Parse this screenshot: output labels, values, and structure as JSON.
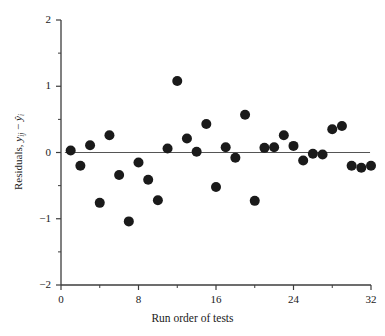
{
  "chart_data": {
    "type": "scatter",
    "title": "",
    "xlabel": "Run order of tests",
    "ylabel": "Residuals, y  − ŷ",
    "ylabel_parts": {
      "lead": "Residuals,",
      "var1": "y",
      "sub1": "ij",
      "minus": "−",
      "var2": "ŷ",
      "sub2": "i"
    },
    "xlim": [
      0,
      32
    ],
    "ylim": [
      -2,
      2
    ],
    "xticks": [
      0,
      8,
      16,
      24,
      32
    ],
    "xticklabels": [
      "0",
      "8",
      "16",
      "24",
      "32"
    ],
    "xminorticks": [
      4,
      12,
      20,
      28
    ],
    "yticks": [
      -2,
      -1,
      0,
      1,
      2
    ],
    "yticklabels": [
      "−2",
      "−1",
      "0",
      "1",
      "2"
    ],
    "yminorticks": [
      -1.5,
      -0.5,
      0.5,
      1.5
    ],
    "grid": false,
    "legend": null,
    "reference_line": {
      "y": 0.0,
      "x_start": 0.4,
      "x_end": 31.9,
      "color": "#555555"
    },
    "marker": {
      "shape": "circle",
      "size": 5.0,
      "color": "#1a1a1a"
    },
    "x": [
      1,
      2,
      3,
      4,
      5,
      6,
      7,
      8,
      9,
      10,
      11,
      12,
      13,
      14,
      15,
      16,
      17,
      18,
      19,
      20,
      21,
      22,
      23,
      24,
      25,
      26,
      27,
      28,
      29,
      30,
      31,
      32
    ],
    "y": [
      0.03,
      -0.2,
      0.11,
      -0.76,
      0.26,
      -0.34,
      -1.04,
      -0.15,
      -0.41,
      -0.72,
      0.06,
      1.08,
      0.21,
      0.01,
      0.43,
      -0.52,
      0.08,
      -0.08,
      0.57,
      -0.73,
      0.07,
      0.08,
      0.26,
      0.1,
      -0.12,
      -0.02,
      -0.03,
      0.35,
      0.4,
      -0.2,
      -0.23,
      -0.2
    ],
    "points": [
      {
        "run": 1,
        "residual": 0.03
      },
      {
        "run": 2,
        "residual": -0.2
      },
      {
        "run": 3,
        "residual": 0.11
      },
      {
        "run": 4,
        "residual": -0.76
      },
      {
        "run": 5,
        "residual": 0.26
      },
      {
        "run": 6,
        "residual": -0.34
      },
      {
        "run": 7,
        "residual": -1.04
      },
      {
        "run": 8,
        "residual": -0.15
      },
      {
        "run": 9,
        "residual": -0.41
      },
      {
        "run": 10,
        "residual": -0.72
      },
      {
        "run": 11,
        "residual": 0.06
      },
      {
        "run": 12,
        "residual": 1.08
      },
      {
        "run": 13,
        "residual": 0.21
      },
      {
        "run": 14,
        "residual": 0.01
      },
      {
        "run": 15,
        "residual": 0.43
      },
      {
        "run": 16,
        "residual": -0.52
      },
      {
        "run": 17,
        "residual": 0.08
      },
      {
        "run": 18,
        "residual": -0.08
      },
      {
        "run": 19,
        "residual": 0.57
      },
      {
        "run": 20,
        "residual": -0.73
      },
      {
        "run": 21,
        "residual": 0.07
      },
      {
        "run": 22,
        "residual": 0.08
      },
      {
        "run": 23,
        "residual": 0.26
      },
      {
        "run": 24,
        "residual": 0.1
      },
      {
        "run": 25,
        "residual": -0.12
      },
      {
        "run": 26,
        "residual": -0.02
      },
      {
        "run": 27,
        "residual": -0.03
      },
      {
        "run": 28,
        "residual": 0.35
      },
      {
        "run": 29,
        "residual": 0.4
      },
      {
        "run": 30,
        "residual": -0.2
      },
      {
        "run": 31,
        "residual": -0.23
      },
      {
        "run": 32,
        "residual": -0.2
      }
    ]
  },
  "colors": {
    "marker": "#1a1a1a",
    "axis": "#3c3c3c",
    "reference_line": "#555555",
    "background": "#ffffff",
    "text": "#1a1a1a"
  }
}
